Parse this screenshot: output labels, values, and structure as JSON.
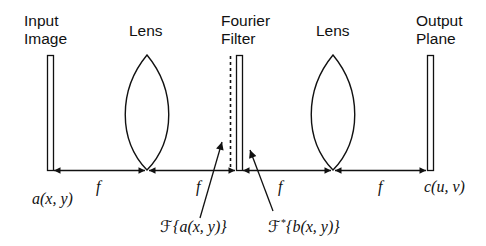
{
  "diagram": {
    "components": [
      {
        "id": "input",
        "label_line1": "Input",
        "label_line2": "Image"
      },
      {
        "id": "lens1",
        "label_line1": "Lens"
      },
      {
        "id": "filter",
        "label_line1": "Fourier",
        "label_line2": "Filter"
      },
      {
        "id": "lens2",
        "label_line1": "Lens"
      },
      {
        "id": "output",
        "label_line1": "Output",
        "label_line2": "Plane"
      }
    ],
    "distances": [
      "f",
      "f",
      "f",
      "f"
    ],
    "annotations": {
      "input_field": "a(x, y)",
      "output_field": "c(u, v)",
      "fourier_transform_prefix": "ℱ",
      "fourier_transform_arg": "{a(x, y)}",
      "filter_prefix": "ℱ",
      "filter_sup": "*",
      "filter_arg": "{b(x, y)}"
    },
    "colors": {
      "stroke": "#111111",
      "background": "#ffffff"
    }
  }
}
